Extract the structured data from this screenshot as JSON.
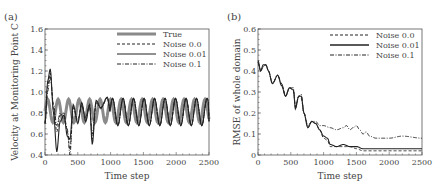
{
  "chart_data": [
    {
      "panel": "(a)",
      "type": "line",
      "title": "",
      "xlabel": "Time step",
      "ylabel": "Velocity at Monitoring Point C",
      "xlim": [
        0,
        2500
      ],
      "ylim": [
        0.4,
        1.6
      ],
      "xticks": [
        0,
        500,
        1000,
        1500,
        2000,
        2500
      ],
      "yticks": [
        0.4,
        0.6,
        0.8,
        1.0,
        1.2,
        1.4,
        1.6
      ],
      "ytick_labels": [
        "0.4",
        "0.6",
        "0.8",
        "1.0",
        "1.2",
        "1.4",
        "1.6"
      ],
      "grid": false,
      "legend_position": "upper right",
      "series": [
        {
          "name": "True",
          "style": "thick-gray",
          "desc": "sinusoid, mean 0.82, amplitude ~0.11, period ~160 steps, from t=0 to 2500"
        },
        {
          "name": "Noise 0.0",
          "style": "dashed",
          "x": [
            0,
            40,
            80,
            130,
            180,
            230,
            290,
            340,
            380,
            430,
            500,
            560,
            620,
            680,
            720,
            780,
            850,
            950,
            1000,
            2500
          ],
          "y": [
            0.7,
            1.05,
            1.18,
            0.85,
            0.62,
            0.78,
            0.8,
            0.62,
            0.45,
            0.85,
            0.72,
            0.88,
            0.75,
            0.88,
            0.55,
            0.9,
            0.85,
            0.95,
            0.8,
            0.8
          ]
        },
        {
          "name": "Noise 0.01",
          "style": "solid",
          "x": [
            0,
            40,
            80,
            130,
            180,
            230,
            290,
            340,
            380,
            430,
            500,
            560,
            620,
            680,
            720,
            780,
            850,
            950,
            1000,
            2500
          ],
          "y": [
            0.7,
            1.1,
            1.22,
            0.8,
            0.43,
            0.72,
            0.78,
            0.58,
            0.55,
            0.88,
            0.7,
            0.9,
            0.72,
            0.88,
            0.5,
            0.92,
            0.85,
            0.95,
            0.8,
            0.8
          ]
        },
        {
          "name": "Noise 0.1",
          "style": "dashdot",
          "x": [
            0,
            40,
            80,
            130,
            180,
            230,
            290,
            340,
            380,
            430,
            500,
            560,
            620,
            680,
            720,
            780,
            850,
            950,
            1000,
            2500
          ],
          "y": [
            0.7,
            1.0,
            1.15,
            0.88,
            0.68,
            0.8,
            0.75,
            0.65,
            0.4,
            0.86,
            0.74,
            0.87,
            0.76,
            0.86,
            0.6,
            0.9,
            0.84,
            0.94,
            0.8,
            0.8
          ]
        }
      ]
    },
    {
      "panel": "(b)",
      "type": "line",
      "title": "",
      "xlabel": "Time step",
      "ylabel": "RMSE of whole domain",
      "xlim": [
        0,
        2500
      ],
      "ylim": [
        0,
        0.6
      ],
      "xticks": [
        0,
        500,
        1000,
        1500,
        2000,
        2500
      ],
      "yticks": [
        0,
        0.1,
        0.2,
        0.3,
        0.4,
        0.5,
        0.6
      ],
      "ytick_labels": [
        "0",
        "0.1",
        "0.2",
        "0.3",
        "0.4",
        "0.5",
        "0.6"
      ],
      "grid": false,
      "legend_position": "upper right",
      "series": [
        {
          "name": "Noise 0.0",
          "style": "dashed",
          "x": [
            0,
            40,
            80,
            120,
            160,
            220,
            300,
            360,
            420,
            480,
            540,
            570,
            620,
            660,
            700,
            760,
            820,
            880,
            940,
            1000,
            1060,
            1100,
            1200,
            1300,
            1400,
            1500,
            1600,
            1700,
            1800,
            2000,
            2200,
            2500
          ],
          "y": [
            0.44,
            0.4,
            0.42,
            0.43,
            0.4,
            0.34,
            0.38,
            0.34,
            0.28,
            0.32,
            0.31,
            0.22,
            0.28,
            0.27,
            0.2,
            0.13,
            0.16,
            0.15,
            0.12,
            0.08,
            0.07,
            0.04,
            0.04,
            0.04,
            0.04,
            0.03,
            0.02,
            0.02,
            0.02,
            0.02,
            0.02,
            0.02
          ]
        },
        {
          "name": "Noise 0.01",
          "style": "solid",
          "x": [
            0,
            40,
            80,
            120,
            160,
            220,
            300,
            360,
            420,
            480,
            540,
            570,
            620,
            660,
            700,
            760,
            820,
            880,
            940,
            1000,
            1060,
            1100,
            1200,
            1300,
            1400,
            1500,
            1600,
            1700,
            1800,
            2000,
            2200,
            2500
          ],
          "y": [
            0.45,
            0.4,
            0.43,
            0.43,
            0.4,
            0.34,
            0.38,
            0.33,
            0.28,
            0.32,
            0.31,
            0.22,
            0.28,
            0.28,
            0.2,
            0.13,
            0.16,
            0.15,
            0.12,
            0.09,
            0.08,
            0.05,
            0.04,
            0.05,
            0.04,
            0.04,
            0.03,
            0.03,
            0.03,
            0.03,
            0.03,
            0.03
          ]
        },
        {
          "name": "Noise 0.1",
          "style": "dashdot",
          "x": [
            0,
            40,
            80,
            120,
            160,
            220,
            300,
            360,
            420,
            480,
            540,
            570,
            620,
            660,
            700,
            760,
            820,
            880,
            940,
            1000,
            1100,
            1200,
            1300,
            1350,
            1400,
            1450,
            1500,
            1550,
            1600,
            1650,
            1700,
            1800,
            2000,
            2200,
            2500
          ],
          "y": [
            0.44,
            0.4,
            0.42,
            0.43,
            0.4,
            0.34,
            0.38,
            0.34,
            0.28,
            0.32,
            0.32,
            0.23,
            0.28,
            0.29,
            0.2,
            0.14,
            0.16,
            0.16,
            0.14,
            0.14,
            0.13,
            0.12,
            0.13,
            0.14,
            0.12,
            0.13,
            0.14,
            0.12,
            0.1,
            0.11,
            0.09,
            0.08,
            0.08,
            0.09,
            0.08
          ]
        }
      ]
    }
  ],
  "panels": {
    "a": {
      "label": "(a)",
      "xlabel": "Time step",
      "ylabel": "Velocity at Monitoring Point C",
      "xtick_labels": [
        "0",
        "500",
        "1000",
        "1500",
        "2000",
        "2500"
      ],
      "ytick_labels": [
        "0.4",
        "0.6",
        "0.8",
        "1.0",
        "1.2",
        "1.4",
        "1.6"
      ],
      "legend": [
        "True",
        "Noise 0.0",
        "Noise 0.01",
        "Noise 0.1"
      ]
    },
    "b": {
      "label": "(b)",
      "xlabel": "Time step",
      "ylabel": "RMSE of whole domain",
      "xtick_labels": [
        "0",
        "500",
        "1000",
        "1500",
        "2000",
        "2500"
      ],
      "ytick_labels": [
        "0",
        "0.1",
        "0.2",
        "0.3",
        "0.4",
        "0.5",
        "0.6"
      ],
      "legend": [
        "Noise 0.0",
        "Noise 0.01",
        "Noise 0.1"
      ]
    }
  },
  "colors": {
    "true_line": "#8a8a8a",
    "ink": "#222222",
    "axis": "#555555"
  }
}
